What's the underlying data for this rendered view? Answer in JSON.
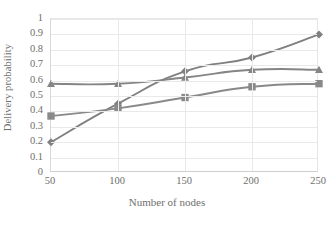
{
  "chart_data": {
    "type": "line",
    "title": "",
    "xlabel": "Number of nodes",
    "ylabel": "Delivery probability",
    "x": [
      50,
      100,
      150,
      200,
      250
    ],
    "xticklabels": [
      "50",
      "100",
      "150",
      "200",
      "250"
    ],
    "yticklabels": [
      "0",
      "0.1",
      "0.2",
      "0.3",
      "0.4",
      "0.5",
      "0.6",
      "0.7",
      "0.8",
      "0.9",
      "1"
    ],
    "ytickvalues": [
      0,
      0.1,
      0.2,
      0.3,
      0.4,
      0.5,
      0.6,
      0.7,
      0.8,
      0.9,
      1
    ],
    "xlim": [
      50,
      250
    ],
    "ylim": [
      0,
      1
    ],
    "grid": "horizontal-and-vertical",
    "legend": "none",
    "series": [
      {
        "name": "series-diamond",
        "marker": "diamond",
        "color": "#808080",
        "values": [
          0.2,
          0.45,
          0.66,
          0.75,
          0.9
        ]
      },
      {
        "name": "series-triangle",
        "marker": "triangle",
        "color": "#858585",
        "values": [
          0.58,
          0.58,
          0.62,
          0.67,
          0.67
        ]
      },
      {
        "name": "series-square",
        "marker": "square",
        "color": "#898989",
        "values": [
          0.37,
          0.42,
          0.49,
          0.56,
          0.58
        ]
      }
    ]
  },
  "colors": {
    "line": "#808080",
    "grid": "#e9e9e9",
    "axis": "#cfcfcf",
    "text": "#6e6e6e",
    "background": "#ffffff"
  }
}
